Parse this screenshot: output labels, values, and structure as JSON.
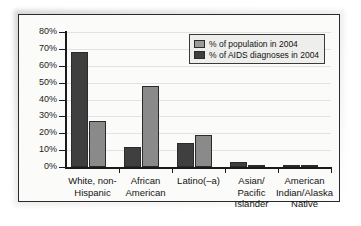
{
  "chart_data": {
    "type": "bar",
    "title": "",
    "xlabel": "",
    "ylabel": "",
    "ylim": [
      0,
      80
    ],
    "ytick_labels": [
      "0%",
      "10%",
      "20%",
      "30%",
      "40%",
      "50%",
      "60%",
      "70%",
      "80%"
    ],
    "ytick_values": [
      0,
      10,
      20,
      30,
      40,
      50,
      60,
      70,
      80
    ],
    "grid": true,
    "legend_position": "top-right",
    "categories": [
      "White, non-Hispanic",
      "African American",
      "Latino(–a)",
      "Asian/ Pacific Islander",
      "American Indian/Alaska Native"
    ],
    "category_lines": [
      [
        "White, non-",
        "Hispanic"
      ],
      [
        "African",
        "American"
      ],
      [
        "Latino(–a)"
      ],
      [
        "Asian/",
        "Pacific",
        "Islander"
      ],
      [
        "American",
        "Indian/Alaska",
        "Native"
      ]
    ],
    "series": [
      {
        "name": "% of AIDS diagnoses in 2004",
        "color": "#3f3f3f",
        "values": [
          68,
          12,
          14,
          3,
          1
        ]
      },
      {
        "name": "% of population in 2004",
        "color": "#8a8a8a",
        "values": [
          27,
          48,
          19,
          1,
          1
        ]
      }
    ]
  },
  "legend": {
    "entries": [
      {
        "label": "% of population in 2004",
        "swatch": "light"
      },
      {
        "label": "% of AIDS diagnoses in 2004",
        "swatch": "dark"
      }
    ]
  }
}
